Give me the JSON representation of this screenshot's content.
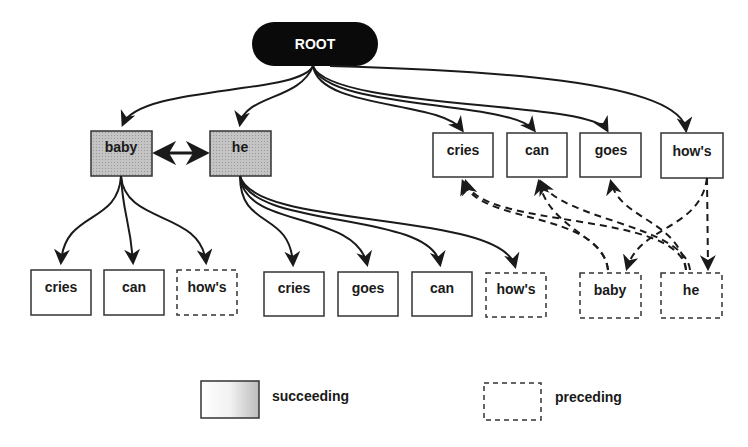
{
  "diagram": {
    "root": {
      "label": "ROOT"
    },
    "level1_succeeding": [
      {
        "label": "baby"
      },
      {
        "label": "he"
      }
    ],
    "level1_plain": [
      {
        "label": "cries"
      },
      {
        "label": "can"
      },
      {
        "label": "goes"
      },
      {
        "label": "how's"
      }
    ],
    "baby_children": [
      {
        "label": "cries",
        "style": "solid"
      },
      {
        "label": "can",
        "style": "solid"
      },
      {
        "label": "how's",
        "style": "dashed"
      }
    ],
    "he_children": [
      {
        "label": "cries",
        "style": "solid"
      },
      {
        "label": "goes",
        "style": "solid"
      },
      {
        "label": "can",
        "style": "solid"
      },
      {
        "label": "how's",
        "style": "dashed"
      }
    ],
    "preceding_nodes": [
      {
        "label": "baby",
        "style": "dashed"
      },
      {
        "label": "he",
        "style": "dashed"
      }
    ],
    "edges": {
      "root_to": [
        "baby",
        "he",
        "cries",
        "can",
        "goes",
        "how's"
      ],
      "bidirectional": [
        "baby",
        "he"
      ],
      "dashed_links": [
        {
          "from": "baby (preceding)",
          "to": "cries"
        },
        {
          "from": "baby (preceding)",
          "to": "can"
        },
        {
          "from": "he (preceding)",
          "to": "cries"
        },
        {
          "from": "he (preceding)",
          "to": "can"
        },
        {
          "from": "he (preceding)",
          "to": "goes"
        },
        {
          "from": "how's",
          "to": "baby (preceding)"
        },
        {
          "from": "how's",
          "to": "he (preceding)"
        }
      ]
    }
  },
  "legend": {
    "succeeding": {
      "label": "succeeding",
      "fill": "gradient-gray",
      "border": "solid"
    },
    "preceding": {
      "label": "preceding",
      "fill": "white",
      "border": "dashed"
    }
  },
  "colors": {
    "root_fill": "#0a0a0a",
    "succeeding_fill": "#bdbdbd",
    "line": "#1a1a1a",
    "border": "#333333"
  }
}
